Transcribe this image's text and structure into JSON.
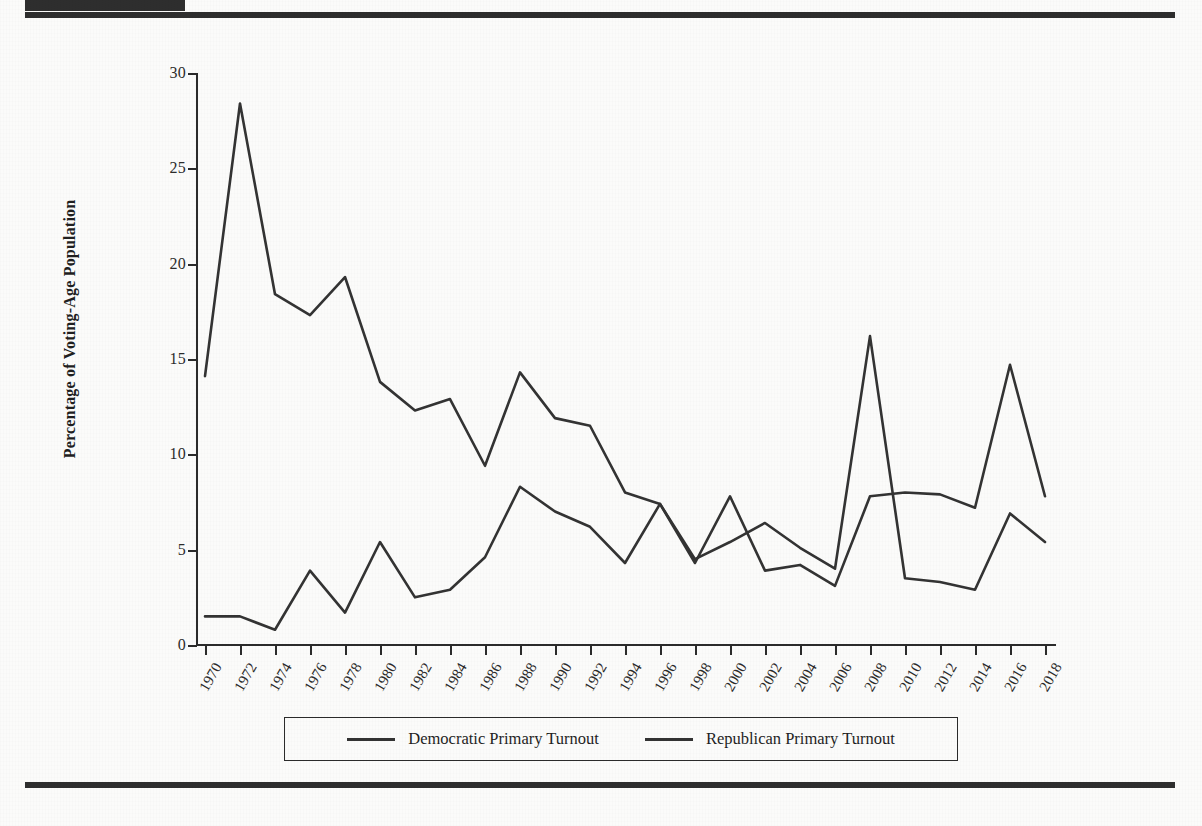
{
  "document": {
    "top_rule": true,
    "bottom_rule": true,
    "corner_block": "redaction-block"
  },
  "legend": {
    "position": "bottom-center",
    "entries": [
      {
        "label": "Democratic Primary Turnout",
        "color": "#333333"
      },
      {
        "label": "Republican Primary Turnout",
        "color": "#333333"
      }
    ]
  },
  "chart_data": {
    "type": "line",
    "title": "",
    "xlabel": "",
    "ylabel": "Percentage of Voting-Age Population",
    "xlim": [
      1970,
      2018
    ],
    "ylim": [
      0,
      30
    ],
    "yticks": [
      0,
      5,
      10,
      15,
      20,
      25,
      30
    ],
    "grid": false,
    "legend_position": "bottom",
    "x": [
      1970,
      1972,
      1974,
      1976,
      1978,
      1980,
      1982,
      1984,
      1986,
      1988,
      1990,
      1992,
      1994,
      1996,
      1998,
      2000,
      2002,
      2004,
      2006,
      2008,
      2010,
      2012,
      2014,
      2016,
      2018
    ],
    "categories": [
      "1970",
      "1972",
      "1974",
      "1976",
      "1978",
      "1980",
      "1982",
      "1984",
      "1986",
      "1988",
      "1990",
      "1992",
      "1994",
      "1996",
      "1998",
      "2000",
      "2002",
      "2004",
      "2006",
      "2008",
      "2010",
      "2012",
      "2014",
      "2016",
      "2018"
    ],
    "series": [
      {
        "name": "Democratic Primary Turnout",
        "color": "#333333",
        "values": [
          14.1,
          28.4,
          18.4,
          17.3,
          19.3,
          13.8,
          12.3,
          12.9,
          9.4,
          14.3,
          11.9,
          11.5,
          8.0,
          7.4,
          4.5,
          5.4,
          6.4,
          5.1,
          4.0,
          16.2,
          3.5,
          3.3,
          2.9,
          6.9,
          5.4
        ]
      },
      {
        "name": "Republican Primary Turnout",
        "color": "#333333",
        "values": [
          1.5,
          1.5,
          0.8,
          3.9,
          1.7,
          5.4,
          2.5,
          2.9,
          4.6,
          8.3,
          7.0,
          6.2,
          4.3,
          7.4,
          4.3,
          7.8,
          3.9,
          4.2,
          3.1,
          7.8,
          8.0,
          7.9,
          7.2,
          14.7,
          7.8
        ]
      }
    ]
  }
}
